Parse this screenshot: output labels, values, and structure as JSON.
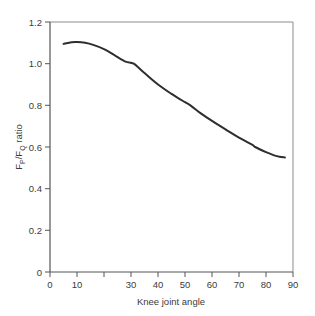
{
  "chart_data": {
    "type": "line",
    "title": "",
    "subtitle": "",
    "xlabel": "Knee joint angle",
    "ylabel": "F_P/F_Q ratio",
    "ylabel_parts": {
      "f1": "F",
      "sub1": "P",
      "slash": "/F",
      "sub2": "Q",
      "tail": " ratio"
    },
    "xlim": [
      0,
      90
    ],
    "ylim": [
      0,
      1.2
    ],
    "xticks": [
      0,
      10,
      20,
      30,
      40,
      50,
      60,
      70,
      80,
      90
    ],
    "xticklabels": [
      "0",
      "10",
      "",
      "30",
      "40",
      "50",
      "60",
      "70",
      "80",
      "90"
    ],
    "yticks": [
      0,
      0.2,
      0.4,
      0.6,
      0.8,
      1.0,
      1.2
    ],
    "yticklabels": [
      "0",
      "0.2",
      "0.4",
      "0.6",
      "0.8",
      "1.0",
      "1.2"
    ],
    "grid": false,
    "legend": "none",
    "line_color": "#2e2e2e",
    "line_width": 2,
    "series": [
      {
        "name": "FP/FQ ratio",
        "x": [
          5,
          8,
          10,
          13,
          16,
          20,
          24,
          28,
          31,
          35,
          40,
          45,
          50,
          52,
          56,
          60,
          65,
          70,
          75,
          76,
          80,
          83,
          85,
          87
        ],
        "y": [
          1.095,
          1.103,
          1.104,
          1.1,
          1.09,
          1.07,
          1.04,
          1.01,
          1.0,
          0.955,
          0.9,
          0.855,
          0.815,
          0.8,
          0.76,
          0.725,
          0.685,
          0.645,
          0.61,
          0.6,
          0.575,
          0.56,
          0.553,
          0.55
        ]
      }
    ]
  },
  "axes": {
    "frame_color": "#8d8d8d",
    "background": "#ffffff"
  }
}
